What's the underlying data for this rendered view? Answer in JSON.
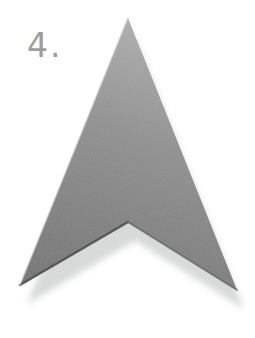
{
  "page": {
    "background": "#ffffff"
  },
  "step": {
    "label": "4.",
    "color": "#9d9d9d"
  },
  "illustration": {
    "description": "large shaded arrowhead (dart) pointing up with soft drop shadow",
    "icon": "arrow-up-icon",
    "colors": {
      "body_top": "#b0b0b0",
      "body_mid": "#909090",
      "body_bottom": "#757575",
      "edge_dark": "#4f4f4f",
      "edge_dark_right": "#646464",
      "edge_light": "#c8c8c8",
      "shadow": "#d8dada"
    }
  }
}
